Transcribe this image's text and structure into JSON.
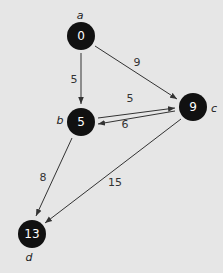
{
  "graph": {
    "nodes": [
      {
        "id": "a",
        "label": "a",
        "value": "0",
        "x": 81,
        "y": 36
      },
      {
        "id": "b",
        "label": "b",
        "value": "5",
        "x": 81,
        "y": 122
      },
      {
        "id": "c",
        "label": "c",
        "value": "9",
        "x": 193,
        "y": 107
      },
      {
        "id": "d",
        "label": "d",
        "value": "13",
        "x": 32,
        "y": 234
      }
    ],
    "edges": [
      {
        "from": "a",
        "to": "b",
        "weight": "5"
      },
      {
        "from": "a",
        "to": "c",
        "weight": "9"
      },
      {
        "from": "b",
        "to": "c",
        "weight": "5"
      },
      {
        "from": "c",
        "to": "b",
        "weight": "6"
      },
      {
        "from": "b",
        "to": "d",
        "weight": "8"
      },
      {
        "from": "c",
        "to": "d",
        "weight": "15"
      }
    ]
  },
  "colors": {
    "background": "#e6e6e6",
    "node_fill": "#111111",
    "node_text": "#ffffff",
    "edge": "#333333"
  }
}
